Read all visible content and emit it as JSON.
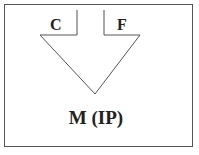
{
  "diagram": {
    "labels": {
      "left_input": "C",
      "right_input": "F",
      "output": "M (IP)"
    },
    "colors": {
      "line": "#555555",
      "text": "#222222",
      "background": "#ffffff"
    }
  }
}
